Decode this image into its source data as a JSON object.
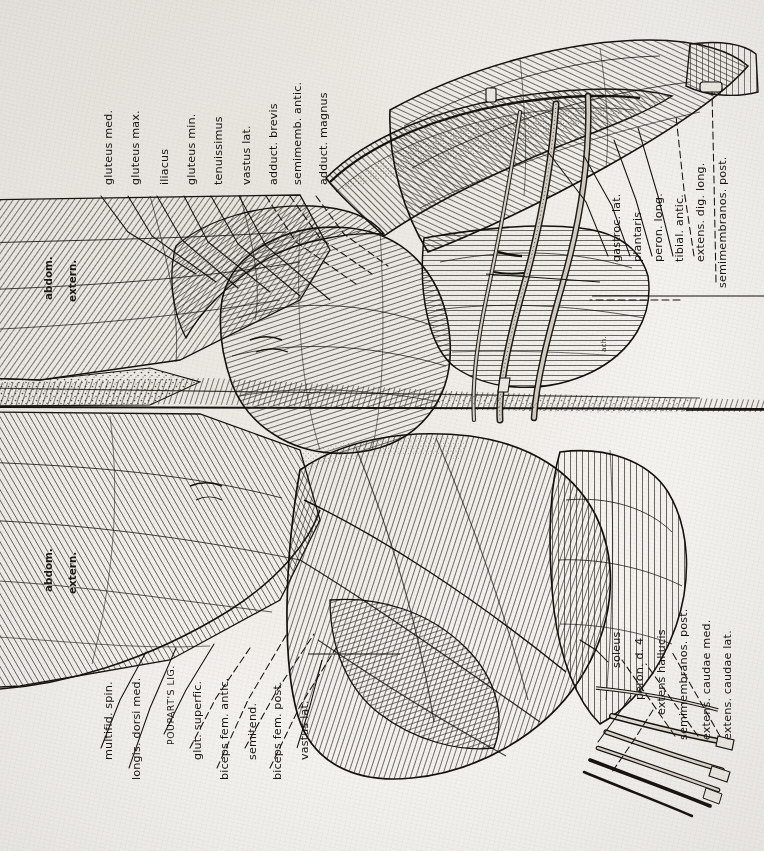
{
  "plate": {
    "title": "Comparative myology plate — hindquarter dissection (superficial & deep layers)",
    "orientation": "labels rotated 90° counter-clockwise, reading bottom-to-top",
    "paper_color": "#f4f2ee",
    "ink_color": "#16130f",
    "engraver_mark": "ach."
  },
  "labels": {
    "upper_left": [
      {
        "text": "gluteus med.",
        "x": 103,
        "y": 185
      },
      {
        "text": "gluteus max.",
        "x": 130,
        "y": 185
      },
      {
        "text": "iliacus",
        "x": 159,
        "y": 185
      },
      {
        "text": "gluteus min.",
        "x": 186,
        "y": 185
      },
      {
        "text": "tenuissimus",
        "x": 213,
        "y": 185
      },
      {
        "text": "vastus lat.",
        "x": 241,
        "y": 185
      },
      {
        "text": "adduct. brevis",
        "x": 268,
        "y": 185
      },
      {
        "text": "semimemb. antic.",
        "x": 292,
        "y": 185
      },
      {
        "text": "adduct. magnus",
        "x": 318,
        "y": 185
      }
    ],
    "upper_right": [
      {
        "text": "gastroc. lat.",
        "x": 611,
        "y": 262
      },
      {
        "text": "plantaris",
        "x": 632,
        "y": 262
      },
      {
        "text": "peron. long.",
        "x": 653,
        "y": 262
      },
      {
        "text": "tibial. antic.",
        "x": 674,
        "y": 262
      },
      {
        "text": "extens. dig. long.",
        "x": 695,
        "y": 262
      },
      {
        "text": "semimembranos. post.",
        "x": 717,
        "y": 288
      }
    ],
    "lower_left": [
      {
        "text": "multifid. spin.",
        "x": 103,
        "y": 760,
        "smallcaps": false
      },
      {
        "text": "longis. dorsi med.",
        "x": 131,
        "y": 780,
        "smallcaps": false
      },
      {
        "text": "POUPART'S LIG.",
        "x": 166,
        "y": 745,
        "smallcaps": true
      },
      {
        "text": "glut. superfic.",
        "x": 192,
        "y": 760,
        "smallcaps": false
      },
      {
        "text": "biceps fem. antic.",
        "x": 219,
        "y": 780,
        "smallcaps": false
      },
      {
        "text": "semitend.",
        "x": 247,
        "y": 760,
        "smallcaps": false
      },
      {
        "text": "biceps fem. post.",
        "x": 272,
        "y": 780,
        "smallcaps": false
      },
      {
        "text": "vastus lat.",
        "x": 299,
        "y": 760,
        "smallcaps": false
      }
    ],
    "lower_right": [
      {
        "text": "soleus",
        "x": 611,
        "y": 668
      },
      {
        "text": "peron. d. 4",
        "x": 634,
        "y": 700
      },
      {
        "text": "extens hallucis",
        "x": 656,
        "y": 715
      },
      {
        "text": "semimembranos. post.",
        "x": 678,
        "y": 740
      },
      {
        "text": "extens. caudae med.",
        "x": 701,
        "y": 740
      },
      {
        "text": "extens. caudae lat.",
        "x": 722,
        "y": 740
      }
    ],
    "on_figure": [
      {
        "text": "abdom.",
        "x": 42,
        "y": 300
      },
      {
        "text": "extern.",
        "x": 66,
        "y": 302
      },
      {
        "text": "abdom.",
        "x": 42,
        "y": 592
      },
      {
        "text": "extern.",
        "x": 66,
        "y": 594
      }
    ],
    "signature": {
      "text": "ach.",
      "x": 600,
      "y": 352
    }
  }
}
